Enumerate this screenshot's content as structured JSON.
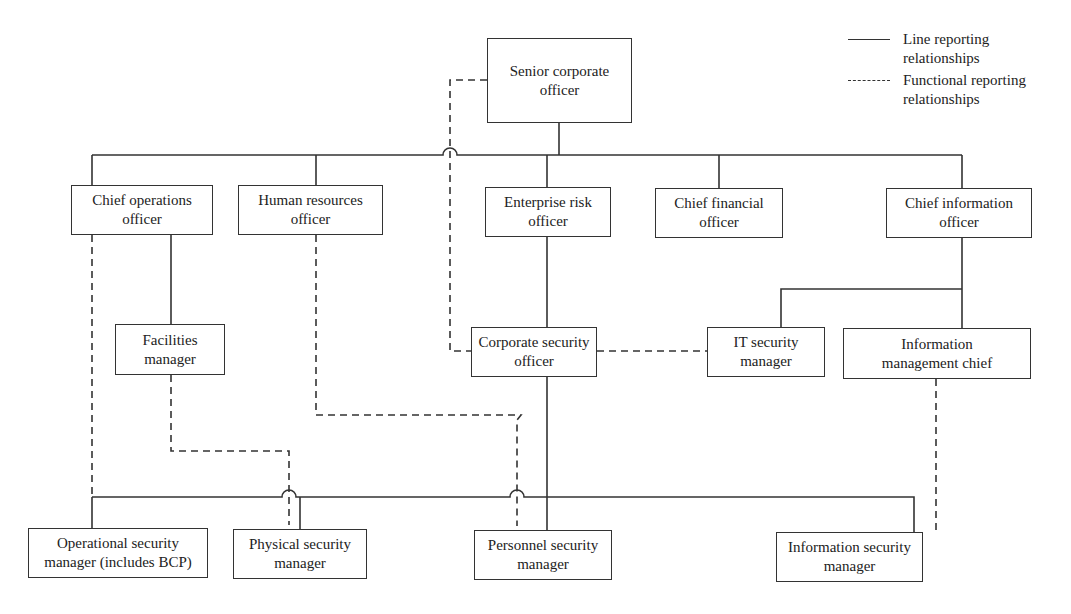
{
  "legend": {
    "line": {
      "label_1": "Line reporting",
      "label_2": "relationships"
    },
    "functional": {
      "label_1": "Functional reporting",
      "label_2": "relationships"
    }
  },
  "nodes": {
    "senior": {
      "line1": "Senior corporate",
      "line2": "officer"
    },
    "coo": {
      "line1": "Chief operations",
      "line2": "officer"
    },
    "hr": {
      "line1": "Human resources",
      "line2": "officer"
    },
    "ero": {
      "line1": "Enterprise risk",
      "line2": "officer"
    },
    "cfo": {
      "line1": "Chief financial",
      "line2": "officer"
    },
    "cio": {
      "line1": "Chief information",
      "line2": "officer"
    },
    "facilities": {
      "line1": "Facilities",
      "line2": "manager"
    },
    "cso": {
      "line1": "Corporate security",
      "line2": "officer"
    },
    "itsec": {
      "line1": "IT security",
      "line2": "manager"
    },
    "imc": {
      "line1": "Information",
      "line2": "management chief"
    },
    "opsec": {
      "line1": "Operational security",
      "line2": "manager (includes BCP)"
    },
    "physec": {
      "line1": "Physical security",
      "line2": "manager"
    },
    "persec": {
      "line1": "Personnel security",
      "line2": "manager"
    },
    "infosec": {
      "line1": "Information security",
      "line2": "manager"
    }
  },
  "colors": {
    "line": "#333333",
    "background": "#ffffff"
  }
}
